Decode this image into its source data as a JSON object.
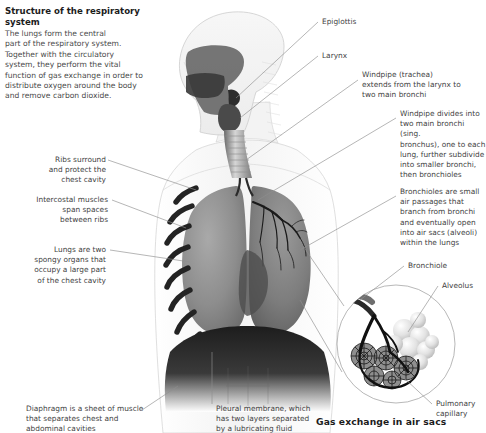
{
  "heading": {
    "title": "Structure of the\nrespiratory system",
    "intro": "The lungs form the central\npart of the respiratory system.\nTogether with the circulatory\nsystem, they perform the vital\nfunction of gas exchange in order to\ndistribute oxygen around the body\nand remove carbon dioxide."
  },
  "caption": "Gas exchange in air sacs",
  "labels": {
    "epiglottis": "Epiglottis",
    "larynx": "Larynx",
    "windpipe": "Windpipe (trachea)\nextends from the larynx to\ntwo main bronchi",
    "bronchi": "Windpipe divides into\ntwo main bronchi (sing.\nbronchus), one to each\nlung, further subdivide\ninto smaller bronchi,\nthen bronchioles",
    "bronchioles": "Bronchioles are small\nair passages that\nbranch from bronchi\nand eventually open\ninto air sacs (alveoli)\nwithin the lungs",
    "bronchiole": "Bronchiole",
    "alveolus": "Alveolus",
    "pulmonary_capillary": "Pulmonary\ncapillary",
    "ribs": "Ribs surround\nand protect the\nchest cavity",
    "intercostal": "Intercostal muscles\nspan spaces\nbetween ribs",
    "lungs": "Lungs are two\nspongy organs that\noccupy a large part\nof the chest cavity",
    "diaphragm": "Diaphragm is a sheet of muscle\nthat separates chest and\nabdominal cavities",
    "pleural": "Pleural membrane, which\nhas two layers separated\nby a lubricating fluid"
  },
  "colors": {
    "background": "#ffffff",
    "text": "#3f3f3f",
    "heading": "#1c1c1c",
    "leader_line": "#8e8e8e",
    "anatomy_dark": "#2a2a2a",
    "anatomy_mid": "#8a8a8a",
    "anatomy_light": "#d8d8d8"
  }
}
